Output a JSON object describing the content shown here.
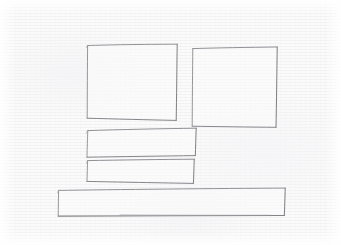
{
  "canvas": {
    "width": 341,
    "height": 245,
    "medium": "pencil-on-paper",
    "paper_color": "#fbfbfb",
    "stroke_color": "#8e8e92",
    "stroke_width": 0.9,
    "description": "Hand-drawn low-fidelity wireframe sketch"
  },
  "sketch": {
    "title": "wireframe-layout-sketch",
    "shape_count": 5,
    "shapes": [
      {
        "id": "box-left",
        "role": "content-block-left",
        "kind": "rectangle",
        "label": "",
        "points": "88,45 177,44 176,120 87,118",
        "x": 87,
        "y": 44,
        "w": 90,
        "h": 76
      },
      {
        "id": "box-right",
        "role": "content-block-right",
        "kind": "rectangle",
        "label": "",
        "points": "193,48 277,47 276,127 192,126",
        "x": 192,
        "y": 47,
        "w": 85,
        "h": 80
      },
      {
        "id": "bar-upper",
        "role": "list-row-upper",
        "kind": "rectangle",
        "label": "",
        "points": "88,130 196,128 195,155 87,157",
        "x": 87,
        "y": 128,
        "w": 109,
        "h": 29
      },
      {
        "id": "bar-lower",
        "role": "list-row-lower",
        "kind": "rectangle",
        "label": "",
        "points": "88,160 194,159 193,183 87,181",
        "x": 87,
        "y": 159,
        "w": 107,
        "h": 24
      },
      {
        "id": "bar-wide",
        "role": "footer-band",
        "kind": "rectangle",
        "label": "",
        "points": "59,190 285,188 284,215 58,216",
        "x": 58,
        "y": 188,
        "w": 227,
        "h": 28
      }
    ]
  },
  "colors": {
    "paper": "#fbfbfb",
    "pencil": "#8e8e92",
    "pencil_light": "#aaaaae",
    "pencil_dark": "#6f6f74"
  }
}
